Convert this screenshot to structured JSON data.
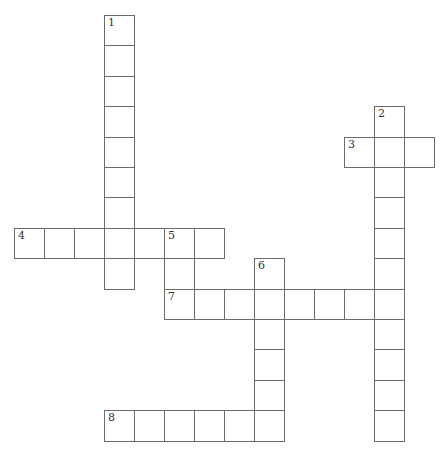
{
  "puzzle": {
    "type": "crossword",
    "grid": {
      "origin_x": 14,
      "origin_y": 15,
      "cell_w": 30,
      "cell_h": 30.4
    },
    "colors": {
      "border": "#6b6b6b",
      "background": "#ffffff",
      "number": "#333333"
    },
    "words": [
      {
        "number": "1",
        "direction": "down",
        "col": 3,
        "row": 0,
        "length": 9
      },
      {
        "number": "2",
        "direction": "down",
        "col": 12,
        "row": 3,
        "length": 11
      },
      {
        "number": "3",
        "direction": "across",
        "col": 11,
        "row": 4,
        "length": 3
      },
      {
        "number": "4",
        "direction": "across",
        "col": 0,
        "row": 7,
        "length": 7
      },
      {
        "number": "5",
        "direction": "down",
        "col": 5,
        "row": 7,
        "length": 2
      },
      {
        "number": "6",
        "direction": "down",
        "col": 8,
        "row": 8,
        "length": 6
      },
      {
        "number": "7",
        "direction": "across",
        "col": 5,
        "row": 9,
        "length": 8
      },
      {
        "number": "8",
        "direction": "across",
        "col": 3,
        "row": 13,
        "length": 6
      }
    ]
  }
}
